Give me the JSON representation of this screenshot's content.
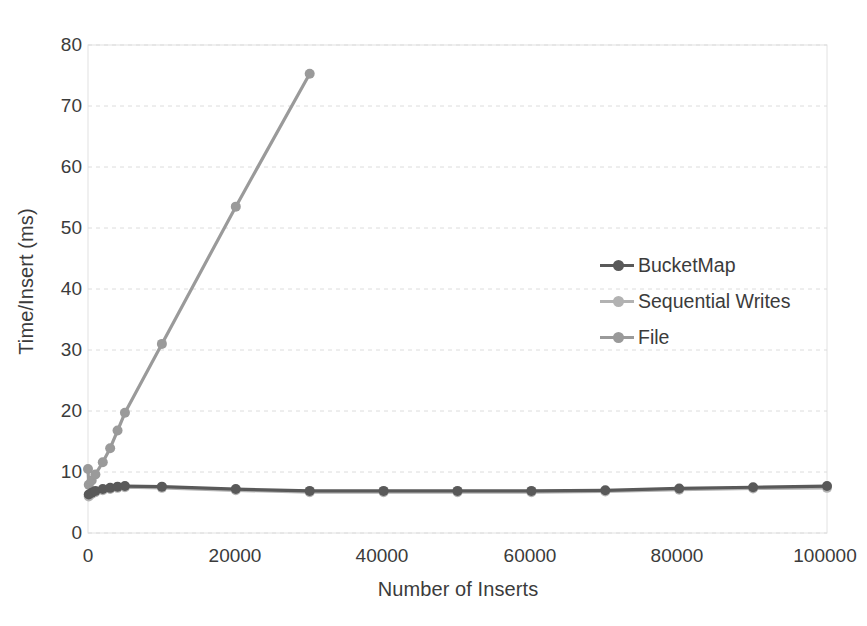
{
  "chart_data": {
    "type": "line",
    "title": "",
    "xlabel": "Number of Inserts",
    "ylabel": "Time/Insert (ms)",
    "xlim": [
      0,
      100000
    ],
    "ylim": [
      0,
      80
    ],
    "xticks": [
      "0",
      "20000",
      "40000",
      "60000",
      "80000",
      "100000"
    ],
    "xtick_values": [
      0,
      20000,
      40000,
      60000,
      80000,
      100000
    ],
    "yticks": [
      "0",
      "10",
      "20",
      "30",
      "40",
      "50",
      "60",
      "70",
      "80"
    ],
    "ytick_values": [
      0,
      10,
      20,
      30,
      40,
      50,
      60,
      70,
      80
    ],
    "grid": "horizontal-dashed",
    "legend_position": "center-right",
    "series": [
      {
        "name": "BucketMap",
        "color": "#595959",
        "marker": "circle",
        "x": [
          100,
          500,
          1000,
          2000,
          3000,
          4000,
          5000,
          10000,
          20000,
          30000,
          40000,
          50000,
          60000,
          70000,
          80000,
          90000,
          100000
        ],
        "y": [
          6.3,
          6.6,
          6.9,
          7.2,
          7.4,
          7.6,
          7.7,
          7.6,
          7.2,
          6.9,
          6.9,
          6.9,
          6.9,
          7.0,
          7.3,
          7.5,
          7.7
        ]
      },
      {
        "name": "Sequential Writes",
        "color": "#b2b2b2",
        "marker": "circle",
        "x": [
          100,
          500,
          1000,
          2000,
          3000,
          4000,
          5000,
          10000,
          20000,
          30000,
          40000,
          50000,
          60000,
          70000,
          80000,
          90000,
          100000
        ],
        "y": [
          6.0,
          6.4,
          6.7,
          7.0,
          7.2,
          7.4,
          7.5,
          7.4,
          7.0,
          6.7,
          6.7,
          6.7,
          6.7,
          6.8,
          7.1,
          7.3,
          7.4
        ]
      },
      {
        "name": "File",
        "color": "#9a9a9a",
        "marker": "circle",
        "x": [
          0,
          100,
          500,
          1000,
          2000,
          3000,
          4000,
          5000,
          10000,
          20000,
          30000
        ],
        "y": [
          10.5,
          7.9,
          8.6,
          9.6,
          11.6,
          13.9,
          16.8,
          19.7,
          31.0,
          53.5,
          75.3
        ]
      }
    ]
  },
  "legend": {
    "items": [
      {
        "label": "BucketMap",
        "color": "#595959"
      },
      {
        "label": "Sequential Writes",
        "color": "#b2b2b2"
      },
      {
        "label": "File",
        "color": "#9a9a9a"
      }
    ]
  },
  "colors": {
    "background": "#ffffff",
    "text": "#3b3b3b",
    "gridline": "#dcdcdc",
    "plot_border": "#e2e2e2"
  }
}
